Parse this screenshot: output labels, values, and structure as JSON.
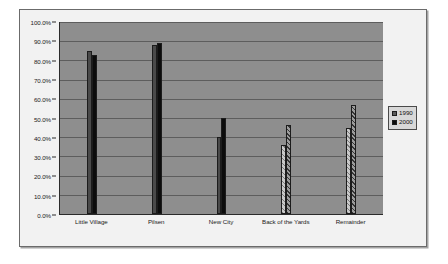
{
  "chart_data": {
    "type": "bar",
    "title": "",
    "subtitle": "",
    "xlabel": "",
    "ylabel": "",
    "categories": [
      "Little Village",
      "Pilsen",
      "New City",
      "Back of the Yards",
      "Remainder"
    ],
    "series": [
      {
        "name": "1990",
        "values": [
          85.0,
          88.0,
          40.0,
          36.0,
          45.0
        ]
      },
      {
        "name": "2000",
        "values": [
          83.0,
          89.0,
          50.0,
          46.5,
          57.0
        ]
      }
    ],
    "ylim": [
      0,
      100
    ],
    "ytick_labels": [
      "0.0%",
      "10.0%",
      "20.0%",
      "30.0%",
      "40.0%",
      "50.0%",
      "60.0%",
      "70.0%",
      "80.0%",
      "90.0%",
      "100.0%"
    ],
    "ytick_values": [
      0,
      10,
      20,
      30,
      40,
      50,
      60,
      70,
      80,
      90,
      100
    ],
    "grid": true,
    "legend_position": "right",
    "legend": [
      {
        "label": "1990",
        "swatch": "gray"
      },
      {
        "label": "2000",
        "swatch": "black"
      }
    ],
    "plot_background_color": "#8e8e8e",
    "chart_background_color": "#f2f2f2",
    "gridline_color": "#5d5d5d",
    "axis_color": "#2b2b2b",
    "series_styles": [
      {
        "name": "1990",
        "fills": [
          "solid-gray",
          "solid-gray",
          "solid-gray",
          "hatch-light",
          "hatch-light"
        ]
      },
      {
        "name": "2000",
        "fills": [
          "solid-black",
          "solid-black",
          "solid-black",
          "hatch-dark",
          "hatch-dark"
        ]
      }
    ]
  }
}
